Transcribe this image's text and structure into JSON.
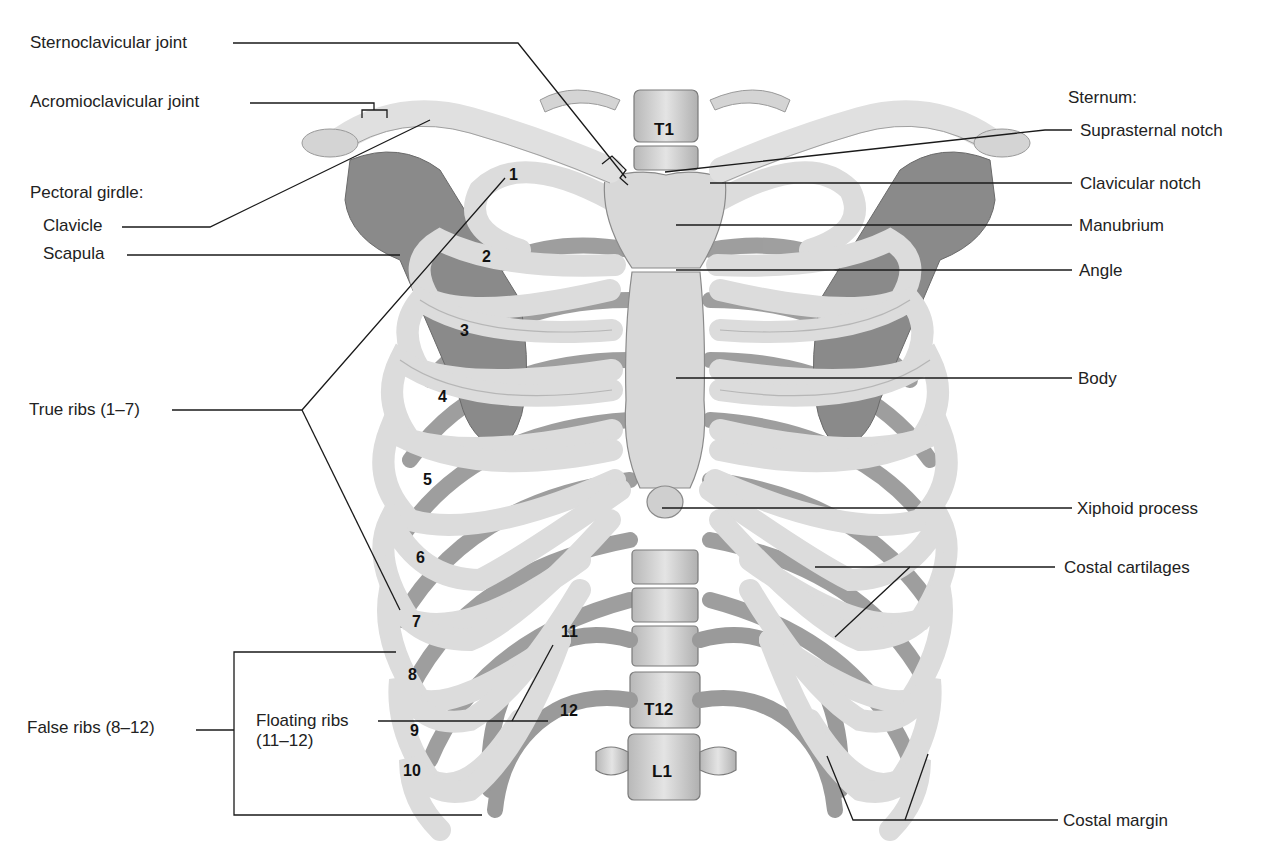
{
  "figure": {
    "colors": {
      "bone": "#e6e6e6",
      "bone_shade": "#a9a9a9",
      "bone_dark": "#7d7d7d",
      "line": "#1a1a1a",
      "background": "#ffffff"
    }
  },
  "labels_left": {
    "sternoclavicular_joint": "Sternoclavicular joint",
    "acromioclavicular_joint": "Acromioclavicular joint",
    "pectoral_girdle_heading": "Pectoral girdle:",
    "clavicle": "Clavicle",
    "scapula": "Scapula",
    "true_ribs": "True ribs (1–7)",
    "false_ribs": "False ribs (8–12)",
    "floating_ribs_line1": "Floating ribs",
    "floating_ribs_line2": "(11–12)"
  },
  "labels_right": {
    "sternum_heading": "Sternum:",
    "suprasternal_notch": "Suprasternal notch",
    "clavicular_notch": "Clavicular notch",
    "manubrium": "Manubrium",
    "angle": "Angle",
    "body": "Body",
    "xiphoid_process": "Xiphoid process",
    "costal_cartilages": "Costal cartilages",
    "costal_margin": "Costal margin"
  },
  "rib_numbers": [
    "1",
    "2",
    "3",
    "4",
    "5",
    "6",
    "7",
    "8",
    "9",
    "10",
    "11",
    "12"
  ],
  "vertebrae": {
    "t1": "T1",
    "t12": "T12",
    "l1": "L1"
  }
}
